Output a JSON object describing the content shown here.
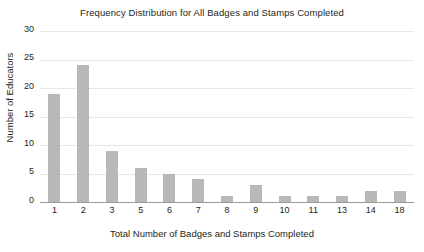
{
  "chart_data": {
    "type": "bar",
    "title": "Frequency Distribution for All Badges and Stamps Completed",
    "xlabel": "Total Number of Badges and Stamps Completed",
    "ylabel": "Number of Educators",
    "categories": [
      "1",
      "2",
      "3",
      "5",
      "6",
      "7",
      "8",
      "9",
      "10",
      "11",
      "13",
      "14",
      "18"
    ],
    "values": [
      19,
      24,
      9,
      6,
      5,
      4,
      1,
      3,
      1,
      1,
      1,
      2,
      2
    ],
    "ylim": [
      0,
      30
    ],
    "yticks": [
      "0",
      "5",
      "10",
      "15",
      "20",
      "25",
      "30"
    ],
    "grid": true,
    "legend": "none",
    "bar_color": "#b9b8b6",
    "background_color": "#ffffff",
    "text_color": "#231f20"
  }
}
